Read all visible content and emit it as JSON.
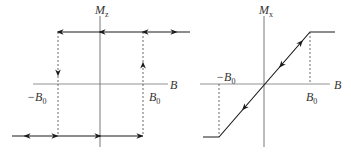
{
  "diagrams": [
    {
      "id": "left",
      "title": "Hysteresis (easy axis)",
      "y_axis_label": "M",
      "y_axis_sub": "z",
      "x_axis_label": "B",
      "neg_label": "−B",
      "neg_sub": "0",
      "pos_label": "B",
      "pos_sub": "0"
    },
    {
      "id": "right",
      "title": "Linear magnetization (hard axis)",
      "y_axis_label": "M",
      "y_axis_sub": "x",
      "x_axis_label": "B",
      "neg_label": "−B",
      "neg_sub": "0",
      "pos_label": "B",
      "pos_sub": "0"
    }
  ],
  "colors": {
    "line": "#1a1a1a",
    "axis": "#555555",
    "dashed": "#444444"
  }
}
